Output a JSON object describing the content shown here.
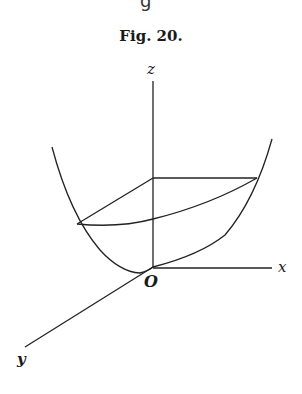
{
  "header": {
    "cut_text": "g"
  },
  "figure": {
    "title": "Fig. 20.",
    "labels": {
      "z": "z",
      "x": "x",
      "y": "y",
      "origin": "O"
    },
    "stroke_color": "#222222"
  }
}
